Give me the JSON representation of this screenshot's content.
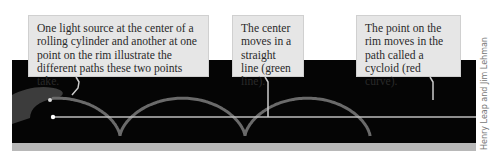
{
  "figure": {
    "callouts": [
      {
        "text": "One light source at the center of a rolling cylinder and another at one point on the rim illustrate the different paths these two points take."
      },
      {
        "text": "The center moves in a straight line (green line)."
      },
      {
        "text": "The point on the rim moves in the path called a cycloid (red curve)."
      }
    ],
    "credit": "Henry Leap and Jim Lehman",
    "colors": {
      "background": "#ffffff",
      "photo": "#050505",
      "callout_fill": "#e6e6e6",
      "cycloid": "#6a6a6a",
      "center_line": "#bdbdbd"
    }
  }
}
